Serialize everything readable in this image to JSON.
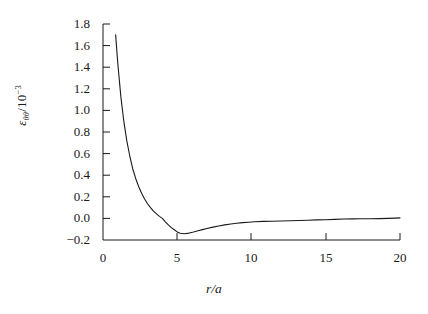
{
  "chart_data": {
    "type": "line",
    "title": "",
    "xlabel": "r/a",
    "ylabel_parts": {
      "symbol": "ε",
      "subscript": "θθ",
      "divider": "/10",
      "exponent": "−3"
    },
    "ylabel_plain": "εθθ/10⁻³",
    "xlim": [
      0,
      20
    ],
    "ylim": [
      -0.2,
      1.8
    ],
    "xticks": [
      "0",
      "5",
      "10",
      "15",
      "20"
    ],
    "xtick_values": [
      0,
      5,
      10,
      15,
      20
    ],
    "yticks": [
      "−0.2",
      "0.0",
      "0.2",
      "0.4",
      "0.6",
      "0.8",
      "1.0",
      "1.2",
      "1.4",
      "1.6",
      "1.8"
    ],
    "ytick_values": [
      -0.2,
      0.0,
      0.2,
      0.4,
      0.6,
      0.8,
      1.0,
      1.2,
      1.4,
      1.6,
      1.8
    ],
    "grid": false,
    "legend": null,
    "axes_style": "left-and-bottom-spines",
    "line_color": "#1a1a1a",
    "line_width": 1.1,
    "series": [
      {
        "name": "hoop strain",
        "x": [
          0.85,
          1.0,
          1.2,
          1.4,
          1.6,
          1.8,
          2.0,
          2.2,
          2.4,
          2.6,
          2.8,
          3.0,
          3.2,
          3.4,
          3.6,
          3.8,
          4.0,
          4.2,
          4.4,
          4.6,
          4.8,
          5.0,
          5.2,
          5.5,
          5.8,
          6.1,
          6.4,
          6.7,
          7.0,
          7.4,
          7.8,
          8.2,
          8.6,
          9.0,
          9.4,
          9.8,
          10.2,
          10.8,
          11.4,
          12.0,
          12.6,
          13.2,
          13.8,
          14.4,
          15.0,
          15.6,
          16.2,
          16.8,
          17.4,
          18.0,
          18.6,
          19.2,
          19.7,
          20.0
        ],
        "y": [
          1.7,
          1.43,
          1.13,
          0.9,
          0.72,
          0.58,
          0.46,
          0.37,
          0.295,
          0.232,
          0.18,
          0.136,
          0.1,
          0.068,
          0.042,
          0.019,
          0.0,
          -0.032,
          -0.06,
          -0.085,
          -0.105,
          -0.125,
          -0.138,
          -0.142,
          -0.136,
          -0.126,
          -0.115,
          -0.104,
          -0.094,
          -0.081,
          -0.07,
          -0.06,
          -0.052,
          -0.045,
          -0.039,
          -0.035,
          -0.031,
          -0.028,
          -0.026,
          -0.024,
          -0.022,
          -0.02,
          -0.017,
          -0.014,
          -0.012,
          -0.009,
          -0.006,
          -0.004,
          -0.003,
          -0.003,
          -0.002,
          0.0,
          0.003,
          0.005
        ]
      }
    ],
    "annotations": {
      "minimum": {
        "x": 5.0,
        "y": -0.142
      },
      "zero_crossing": {
        "x": 4.0,
        "y": 0.0
      },
      "start_point": {
        "x": 0.85,
        "y": 1.7
      }
    }
  },
  "figure": {
    "background_color": "#ffffff",
    "text_color": "#1a1a1a"
  }
}
